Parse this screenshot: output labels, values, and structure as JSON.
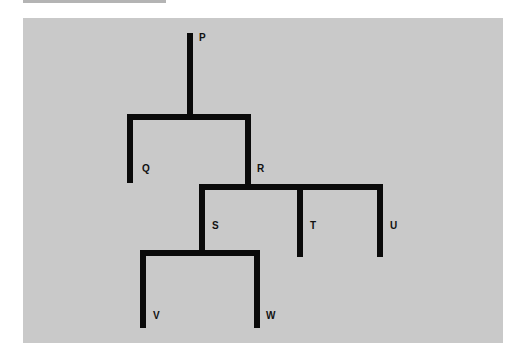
{
  "diagram": {
    "type": "tree",
    "colors": {
      "background": "#c9c9c9",
      "edges": "#0a0a0a",
      "strip": "#b4b4b4"
    },
    "nodes": {
      "P": "P",
      "Q": "Q",
      "R": "R",
      "S": "S",
      "T": "T",
      "U": "U",
      "V": "V",
      "W": "W"
    },
    "edges": [
      [
        "P",
        "Q"
      ],
      [
        "P",
        "R"
      ],
      [
        "R",
        "S"
      ],
      [
        "R",
        "T"
      ],
      [
        "R",
        "U"
      ],
      [
        "S",
        "V"
      ],
      [
        "S",
        "W"
      ]
    ]
  }
}
